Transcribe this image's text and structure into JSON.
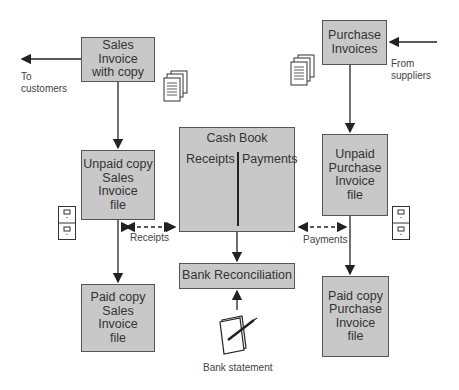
{
  "diagram": {
    "boxes": {
      "sales_invoice": "Sales Invoice\nwith copy",
      "purchase_invoices": "Purchase\nInvoices",
      "unpaid_sales": "Unpaid copy\nSales Invoice\nfile",
      "cash_book": {
        "title": "Cash Book",
        "left": "Receipts",
        "right": "Payments"
      },
      "unpaid_purchase": "Unpaid\nPurchase\nInvoice\nfile",
      "bank_reconciliation": "Bank Reconciliation",
      "paid_sales": "Paid copy\nSales Invoice\nfile",
      "paid_purchase": "Paid copy\nPurchase\nInvoice\nfile"
    },
    "labels": {
      "to_customers": "To\ncustomers",
      "from_suppliers": "From\nsuppliers",
      "receipts": "Receipts",
      "payments": "Payments",
      "bank_statement": "Bank statement"
    },
    "colors": {
      "box_fill": "#c8c8c8",
      "line": "#222222"
    }
  }
}
